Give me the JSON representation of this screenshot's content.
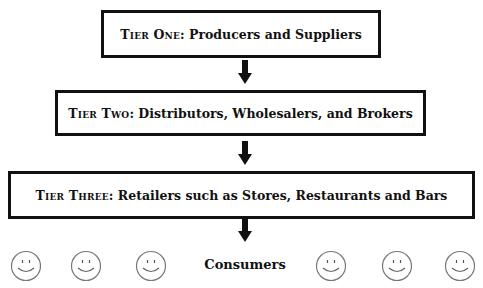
{
  "diagram": {
    "tiers": [
      {
        "prefix": "Tier One",
        "separator": ": ",
        "text": "Producers and Suppliers"
      },
      {
        "prefix": "Tier Two",
        "separator": ": ",
        "text": "Distributors, Wholesalers, and Brokers"
      },
      {
        "prefix": "Tier Three",
        "separator": ": ",
        "text": "Retailers such as Stores, Restaurants and Bars"
      }
    ],
    "consumers_label": "Consumers",
    "consumer_icons": [
      "smiley-icon",
      "smiley-icon",
      "smiley-icon",
      "smiley-icon",
      "smiley-icon",
      "smiley-icon"
    ],
    "colors": {
      "border": "#111111",
      "arrow": "#111111",
      "smiley": "#777777",
      "background": "#ffffff"
    }
  }
}
